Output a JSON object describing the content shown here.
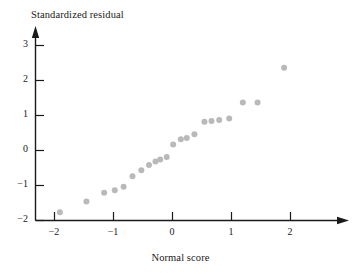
{
  "chart_data": {
    "type": "scatter",
    "title": "",
    "xlabel": "Normal score",
    "ylabel": "Standardized residual",
    "xlim": [
      -2.35,
      2.3
    ],
    "ylim": [
      -2.1,
      3.35
    ],
    "xticks": [
      -2,
      -1,
      0,
      1,
      2
    ],
    "xtick_labels": [
      "−2",
      "−1",
      "0",
      "1",
      "2"
    ],
    "yticks": [
      -2,
      -1,
      0,
      1,
      2,
      3
    ],
    "ytick_labels": [
      "−2",
      "−1",
      "0",
      "1",
      "2",
      "3"
    ],
    "grid": false,
    "legend": null,
    "marker": {
      "shape": "circle",
      "color": "#b9b9b9",
      "size_px": 4.2
    },
    "points": [
      {
        "x": -1.9,
        "y": -1.78
      },
      {
        "x": -1.45,
        "y": -1.47
      },
      {
        "x": -1.15,
        "y": -1.22
      },
      {
        "x": -0.97,
        "y": -1.15
      },
      {
        "x": -0.82,
        "y": -1.05
      },
      {
        "x": -0.67,
        "y": -0.75
      },
      {
        "x": -0.52,
        "y": -0.58
      },
      {
        "x": -0.39,
        "y": -0.43
      },
      {
        "x": -0.28,
        "y": -0.33
      },
      {
        "x": -0.2,
        "y": -0.27
      },
      {
        "x": -0.09,
        "y": -0.2
      },
      {
        "x": 0.02,
        "y": 0.16
      },
      {
        "x": 0.15,
        "y": 0.31
      },
      {
        "x": 0.25,
        "y": 0.34
      },
      {
        "x": 0.38,
        "y": 0.45
      },
      {
        "x": 0.55,
        "y": 0.81
      },
      {
        "x": 0.67,
        "y": 0.83
      },
      {
        "x": 0.8,
        "y": 0.86
      },
      {
        "x": 0.97,
        "y": 0.9
      },
      {
        "x": 1.2,
        "y": 1.36
      },
      {
        "x": 1.45,
        "y": 1.36
      },
      {
        "x": 1.9,
        "y": 2.35
      }
    ]
  },
  "axes": {
    "y_title": "Standardized residual",
    "x_title": "Normal score"
  }
}
